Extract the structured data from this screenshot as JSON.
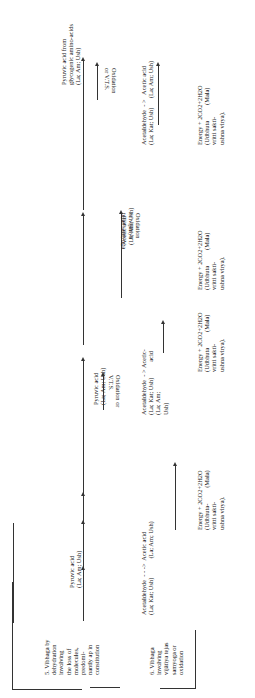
{
  "rows": [
    {
      "label": "5. Vibhaga by\ndehydration\ninvolving\nthe loss of\nmolecules,\npredomi-\nnantly ap in\nconstitution"
    },
    {
      "label": "6. Vibhaga\ninvolving\nvijātiya tejas\nsamyoga or\noxidation"
    }
  ],
  "columns": [
    {
      "top": "Pyruvic acid\n(La; Am; Ush)",
      "mid": "Acetaldehyde  - - ->  Acetic acid\n(La; Kat; Ush)            (La; Am; Ush)",
      "bottom": "Energy + 2CO2+2H2O\n(Udbhuta-          (Mala)\nvritti sakti-\nushna virya)."
    },
    {
      "top": "Pyruvic acid\n(La; Am; Ush)",
      "arrow_label": "Oxidation or\nV.T.S.",
      "mid": "Acetaldehyde  - > Acetic-\n(La; Kat; Ush)          acid\n(La; Am;\nUsh)",
      "bottom": "Energy + 2CO2+2H2O\n(Udbhuta          (Mala)\nvritti sakti-\nushna virya)."
    },
    {
      "top": "Acetic acid\n(La; Am; Ush)",
      "arrow_label": "Oxidation\nor vijātiya\ntejas samyoga",
      "bottom": "Energy + 2CO2+2H2O\n(Udbhuta          (Mala)\nvritti sakti-\nushna virya)."
    },
    {
      "top": "Pyruvic acid from\nglycogenic amino-acids\n(La; Am; Ush)",
      "arrow_label": "Oxidation\nor V.T.S.",
      "mid": "Acetaldehyde  - >   Acetic acid\n(La; Kat; Ush)      (La; Am; Ush)",
      "bottom": "Energy + 2CO2+2H2O\n(Udbhuta          (Mala)\nvritti sakti-\nushna virya)."
    }
  ]
}
